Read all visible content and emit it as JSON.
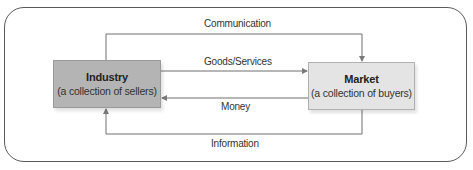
{
  "diagram": {
    "nodes": {
      "industry": {
        "title": "Industry",
        "subtitle": "(a collection of sellers)",
        "fill": "#b4b4b4"
      },
      "market": {
        "title": "Market",
        "subtitle": "(a collection of buyers)",
        "fill": "#e4e4e4"
      }
    },
    "edges": [
      {
        "label": "Communication",
        "from": "industry",
        "to": "market"
      },
      {
        "label": "Goods/Services",
        "from": "industry",
        "to": "market"
      },
      {
        "label": "Money",
        "from": "market",
        "to": "industry"
      },
      {
        "label": "Information",
        "from": "market",
        "to": "industry"
      }
    ],
    "line_color": "#6e6e6e",
    "frame_color": "#5a5a5a"
  }
}
